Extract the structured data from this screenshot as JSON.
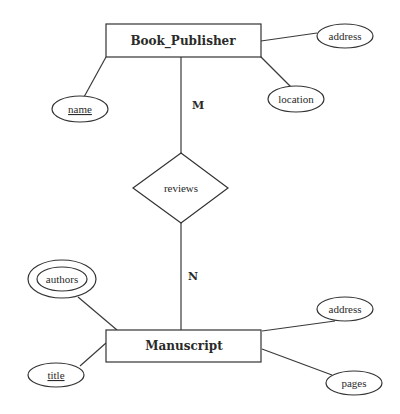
{
  "diagram": {
    "type": "er-diagram",
    "entities": [
      {
        "id": "book_publisher",
        "label": "Book_Publisher"
      },
      {
        "id": "manuscript",
        "label": "Manuscript"
      }
    ],
    "relationship": {
      "label": "reviews",
      "cardinality_top": "M",
      "cardinality_bottom": "N"
    },
    "book_publisher_attributes": {
      "address": "address",
      "name": "name",
      "location": "location"
    },
    "manuscript_attributes": {
      "authors": "authors",
      "title": "title",
      "address": "address",
      "pages": "pages"
    }
  }
}
